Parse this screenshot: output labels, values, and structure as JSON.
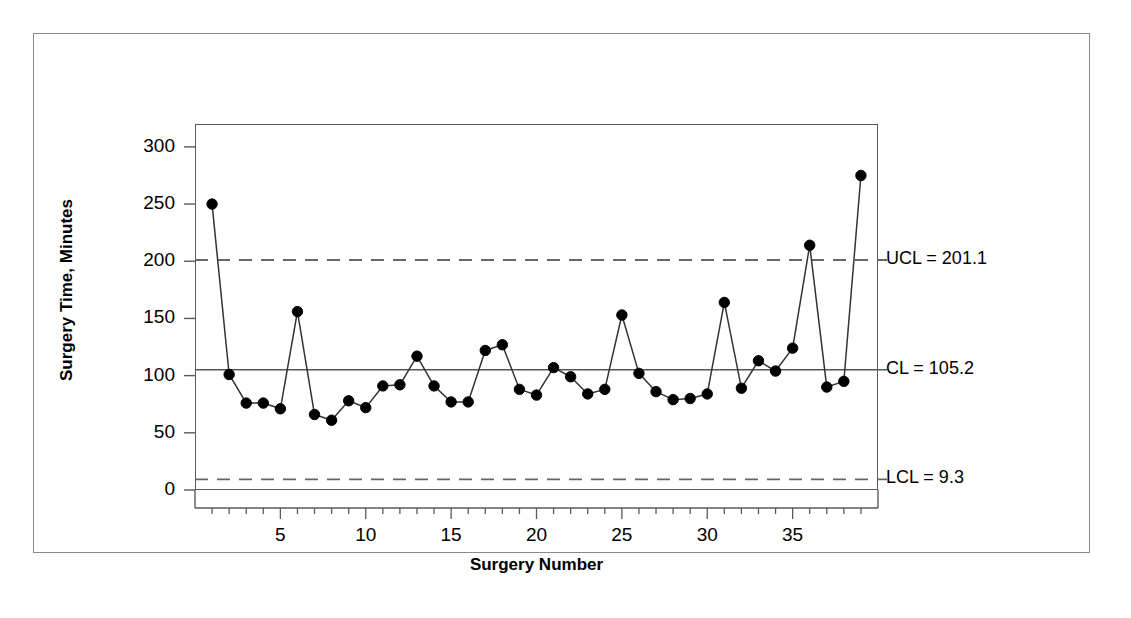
{
  "chart_data": {
    "type": "line",
    "title": "",
    "xlabel": "Surgery Number",
    "ylabel": "Surgery Time, Minutes",
    "xlim": [
      0,
      40
    ],
    "ylim": [
      0,
      320
    ],
    "grid": false,
    "legend": "none",
    "x": [
      1,
      2,
      3,
      4,
      5,
      6,
      7,
      8,
      9,
      10,
      11,
      12,
      13,
      14,
      15,
      16,
      17,
      18,
      19,
      20,
      21,
      22,
      23,
      24,
      25,
      26,
      27,
      28,
      29,
      30,
      31,
      32,
      33,
      34,
      35,
      36,
      37,
      38,
      39
    ],
    "values": [
      250,
      101,
      76,
      76,
      71,
      156,
      66,
      61,
      78,
      72,
      91,
      92,
      117,
      91,
      77,
      77,
      122,
      127,
      88,
      83,
      107,
      99,
      84,
      88,
      153,
      102,
      86,
      79,
      80,
      84,
      164,
      89,
      113,
      104,
      124,
      214,
      90,
      95,
      275
    ],
    "series": [
      {
        "name": "Surgery Time",
        "values": [
          250,
          101,
          76,
          76,
          71,
          156,
          66,
          61,
          78,
          72,
          91,
          92,
          117,
          91,
          77,
          77,
          122,
          127,
          88,
          83,
          107,
          99,
          84,
          88,
          153,
          102,
          86,
          79,
          80,
          84,
          164,
          89,
          113,
          104,
          124,
          214,
          90,
          95,
          275
        ]
      }
    ],
    "x_tick_labels": [
      "5",
      "10",
      "15",
      "20",
      "25",
      "30",
      "35"
    ],
    "x_tick_values": [
      5,
      10,
      15,
      20,
      25,
      30,
      35
    ],
    "y_tick_labels": [
      "0",
      "50",
      "100",
      "150",
      "200",
      "250",
      "300"
    ],
    "y_tick_values": [
      0,
      50,
      100,
      150,
      200,
      250,
      300
    ],
    "control_limits": {
      "ucl": {
        "value": 201.1,
        "label": "UCL = 201.1",
        "style": "dashed"
      },
      "cl": {
        "value": 105.2,
        "label": "CL = 105.2",
        "style": "solid"
      },
      "lcl": {
        "value": 9.3,
        "label": "LCL = 9.3",
        "style": "dashed"
      }
    },
    "colors": {
      "line": "#333333",
      "marker": "#000000",
      "center_line": "#555555",
      "limit_line": "#666666",
      "axis": "#5a5a5a",
      "frame": "#8a8a8a",
      "text": "#000000"
    }
  },
  "axes": {
    "y_title": "Surgery Time, Minutes",
    "x_title": "Surgery Number",
    "y_ticks": [
      {
        "label": "300"
      },
      {
        "label": "250"
      },
      {
        "label": "200"
      },
      {
        "label": "150"
      },
      {
        "label": "100"
      },
      {
        "label": "50"
      },
      {
        "label": "0"
      }
    ],
    "x_ticks": [
      {
        "label": "5"
      },
      {
        "label": "10"
      },
      {
        "label": "15"
      },
      {
        "label": "20"
      },
      {
        "label": "25"
      },
      {
        "label": "30"
      },
      {
        "label": "35"
      }
    ]
  },
  "annotations": {
    "ucl_label": "UCL = 201.1",
    "cl_label": "CL = 105.2",
    "lcl_label": "LCL = 9.3"
  }
}
